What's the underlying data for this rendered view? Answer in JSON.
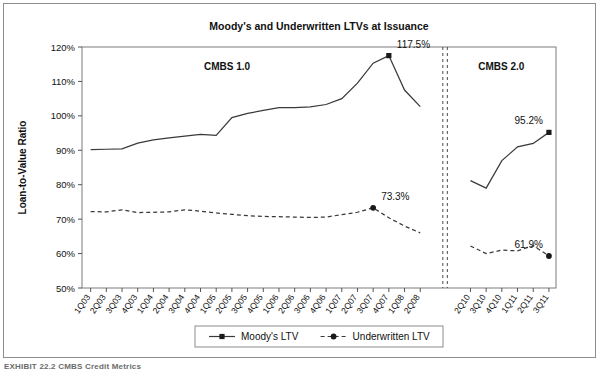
{
  "figure": {
    "caption_partial": "EXHIBIT 22.2  CMBS Credit Metrics",
    "frame_color": "#8c8c8c"
  },
  "chart_data": {
    "type": "line",
    "title": "Moody's and Underwritten LTVs at Issuance",
    "xlabel": "",
    "ylabel": "Loan-to-Value Ratio",
    "ylim": [
      50,
      120
    ],
    "ytick_step": 10,
    "ytick_labels": [
      "50%",
      "60%",
      "70%",
      "80%",
      "90%",
      "100%",
      "110%",
      "120%"
    ],
    "grid": false,
    "legend_position": "bottom",
    "axis_break": true,
    "segments": [
      {
        "name": "CMBS 1.0",
        "label": "CMBS 1.0",
        "categories": [
          "1Q03",
          "2Q03",
          "3Q03",
          "4Q03",
          "1Q04",
          "2Q04",
          "3Q04",
          "4Q04",
          "1Q05",
          "2Q05",
          "3Q05",
          "4Q05",
          "1Q06",
          "2Q06",
          "3Q06",
          "4Q06",
          "1Q07",
          "2Q07",
          "3Q07",
          "4Q07",
          "1Q08",
          "2Q08"
        ],
        "series": [
          {
            "name": "Moody's LTV",
            "marker": "square",
            "dash": false,
            "values": [
              90.2,
              90.3,
              90.4,
              92.1,
              93.0,
              93.6,
              94.1,
              94.6,
              94.3,
              99.5,
              100.7,
              101.6,
              102.4,
              102.4,
              102.6,
              103.3,
              105.0,
              109.5,
              115.3,
              117.5,
              107.5,
              102.7
            ]
          },
          {
            "name": "Underwritten LTV",
            "marker": "circle",
            "dash": true,
            "values": [
              72.2,
              72.1,
              72.7,
              71.9,
              72.0,
              72.1,
              72.7,
              72.3,
              71.8,
              71.4,
              71.0,
              70.8,
              70.7,
              70.6,
              70.5,
              70.6,
              71.3,
              72.0,
              73.3,
              70.4,
              68.0,
              66.0
            ]
          }
        ]
      },
      {
        "name": "CMBS 2.0",
        "label": "CMBS 2.0",
        "categories": [
          "2Q10",
          "3Q10",
          "4Q10",
          "1Q11",
          "2Q11",
          "3Q11"
        ],
        "series": [
          {
            "name": "Moody's LTV",
            "marker": "square",
            "dash": false,
            "values": [
              81.2,
              79.0,
              87.0,
              91.0,
              92.0,
              95.2
            ]
          },
          {
            "name": "Underwritten LTV",
            "marker": "circle",
            "dash": true,
            "values": [
              62.2,
              60.0,
              61.0,
              60.8,
              62.3,
              59.3
            ]
          }
        ]
      }
    ],
    "annotations": [
      {
        "text": "117.5%",
        "series": "Moody's LTV",
        "segment": "CMBS 1.0",
        "category": "4Q07",
        "value": 117.5
      },
      {
        "text": "73.3%",
        "series": "Underwritten LTV",
        "segment": "CMBS 1.0",
        "category": "3Q07",
        "value": 73.3
      },
      {
        "text": "95.2%",
        "series": "Moody's LTV",
        "segment": "CMBS 2.0",
        "category": "3Q11",
        "value": 95.2
      },
      {
        "text": "61.9%",
        "series": "Underwritten LTV",
        "segment": "CMBS 2.0",
        "category": "3Q11",
        "value": 59.3
      }
    ],
    "legend": [
      {
        "label": "Moody's LTV",
        "marker": "square",
        "dash": false
      },
      {
        "label": "Underwritten LTV",
        "marker": "circle",
        "dash": true
      }
    ]
  }
}
